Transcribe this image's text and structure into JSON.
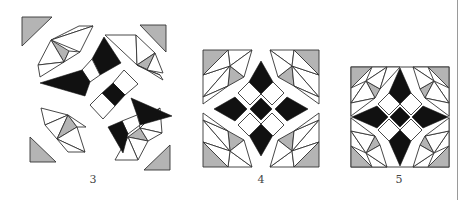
{
  "figures": [
    {
      "label": "3",
      "description": "Exploded quilt block: corner triangles, fan wedges and dark kite pieces pulled apart"
    },
    {
      "label": "4",
      "description": "Partially assembled block: four corner fans around a dark four-point star"
    },
    {
      "label": "5",
      "description": "Fully assembled square quilt block with dark star and gray corner triangles"
    }
  ],
  "colors": {
    "dark": "#111111",
    "gray": "#b4b4b4",
    "light": "#ffffff",
    "outline": "#333333"
  }
}
